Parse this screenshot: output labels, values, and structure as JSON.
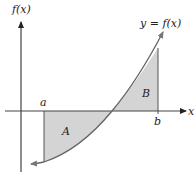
{
  "diagram": {
    "y_axis_label": "f(x)",
    "x_axis_label": "x",
    "curve_label": "y = f(x)",
    "point_a": "a",
    "point_b": "b",
    "region_a": "A",
    "region_b": "B",
    "colors": {
      "axis": "#333333",
      "curve": "#666666",
      "shade": "#d4d4d4",
      "text": "#222222"
    }
  }
}
